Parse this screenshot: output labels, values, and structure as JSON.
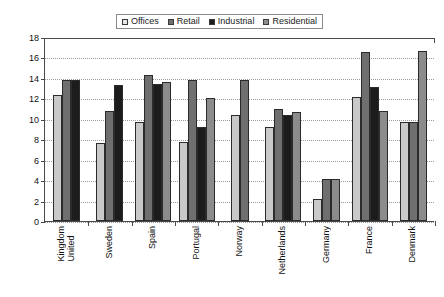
{
  "legend": {
    "items": [
      {
        "label": "Offices",
        "key": "offices",
        "color": "#e8e8e8"
      },
      {
        "label": "Retail",
        "key": "retail",
        "color": "#6f6f6f"
      },
      {
        "label": "Industrial",
        "key": "industrial",
        "color": "#1c1c1c"
      },
      {
        "label": "Residential",
        "key": "residential",
        "color": "#8c8c8c"
      }
    ]
  },
  "axis": {
    "y_ticks": [
      "0",
      "2",
      "4",
      "6",
      "8",
      "10",
      "12",
      "14",
      "16",
      "18"
    ]
  },
  "chart_data": {
    "type": "bar",
    "title": "",
    "xlabel": "",
    "ylabel": "",
    "ylim": [
      0,
      18
    ],
    "ytick_step": 2,
    "grid": true,
    "legend_position": "top-center",
    "categories": [
      "United Kingdom",
      "Sweden",
      "Spain",
      "Portugal",
      "Norway",
      "Netherlands",
      "Germany",
      "France",
      "Denmark"
    ],
    "category_lines": [
      [
        "United",
        "Kingdom"
      ],
      [
        "Sweden"
      ],
      [
        "Spain"
      ],
      [
        "Portugal"
      ],
      [
        "Norway"
      ],
      [
        "Netherlands"
      ],
      [
        "Germany"
      ],
      [
        "France"
      ],
      [
        "Denmark"
      ]
    ],
    "series": [
      {
        "name": "Offices",
        "key": "offices",
        "color": "#c9c9c9",
        "values": [
          12.3,
          7.6,
          9.7,
          7.7,
          10.4,
          9.2,
          2.2,
          12.1,
          9.7
        ]
      },
      {
        "name": "Retail",
        "key": "retail",
        "color": "#6f6f6f",
        "values": [
          13.8,
          10.8,
          14.3,
          13.8,
          13.8,
          11.0,
          4.1,
          16.5,
          9.7
        ]
      },
      {
        "name": "Industrial",
        "key": "industrial",
        "color": "#1c1c1c",
        "values": [
          13.8,
          13.3,
          13.4,
          9.2,
          null,
          10.4,
          null,
          13.1,
          null
        ]
      },
      {
        "name": "Residential",
        "key": "residential",
        "color": "#8c8c8c",
        "values": [
          null,
          null,
          13.6,
          12.0,
          null,
          10.7,
          4.1,
          10.8,
          16.6
        ]
      }
    ]
  }
}
